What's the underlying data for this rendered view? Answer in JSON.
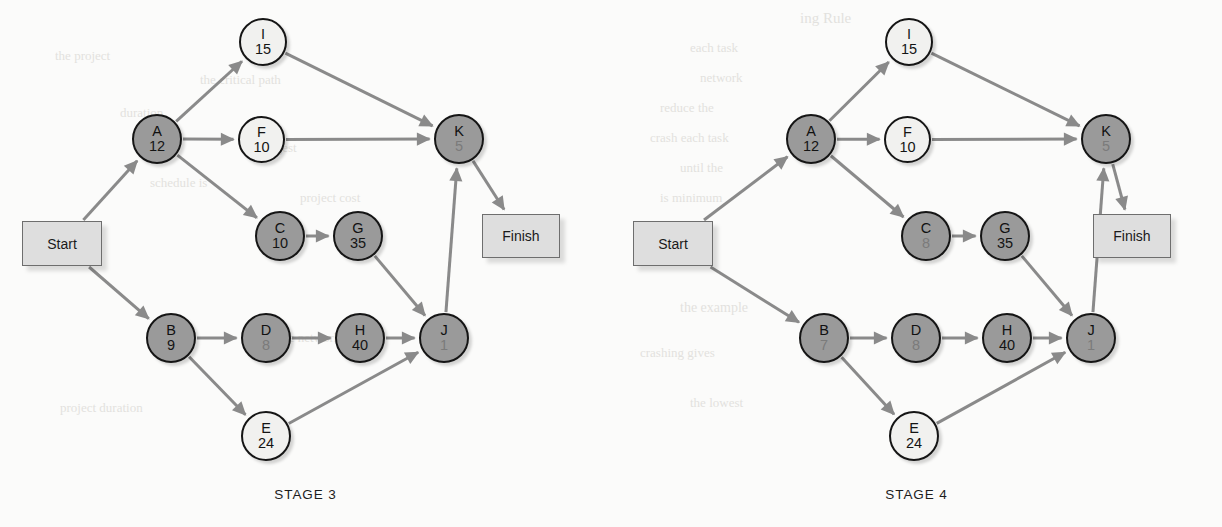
{
  "figure": {
    "background_color": "#fbfbfa",
    "node_dark_color": "#9a9a9a",
    "node_light_color": "#f1f1ef",
    "edge_color": "#8a8a8a",
    "terminal_box_color": "#dedede"
  },
  "bleed_text": [
    {
      "text": "ing Rule",
      "x": 800,
      "y": 10,
      "size": 15
    },
    {
      "text": "the project",
      "x": 55,
      "y": 48,
      "size": 13
    },
    {
      "text": "each task",
      "x": 690,
      "y": 40,
      "size": 13
    },
    {
      "text": "the critical path",
      "x": 200,
      "y": 72,
      "size": 13
    },
    {
      "text": "network",
      "x": 700,
      "y": 70,
      "size": 13
    },
    {
      "text": "duration",
      "x": 120,
      "y": 105,
      "size": 13
    },
    {
      "text": "reduce the",
      "x": 660,
      "y": 100,
      "size": 13
    },
    {
      "text": "the longest",
      "x": 240,
      "y": 140,
      "size": 13
    },
    {
      "text": "crash each task",
      "x": 650,
      "y": 130,
      "size": 13
    },
    {
      "text": "schedule is",
      "x": 150,
      "y": 175,
      "size": 13
    },
    {
      "text": "until the",
      "x": 680,
      "y": 160,
      "size": 13
    },
    {
      "text": "project cost",
      "x": 300,
      "y": 190,
      "size": 13
    },
    {
      "text": "is minimum",
      "x": 660,
      "y": 190,
      "size": 13
    },
    {
      "text": "the example",
      "x": 680,
      "y": 300,
      "size": 14
    },
    {
      "text": "from the network",
      "x": 250,
      "y": 330,
      "size": 13
    },
    {
      "text": "crashing gives",
      "x": 640,
      "y": 345,
      "size": 13
    },
    {
      "text": "project duration",
      "x": 60,
      "y": 400,
      "size": 13
    },
    {
      "text": "the lowest",
      "x": 690,
      "y": 395,
      "size": 13
    }
  ],
  "stages": [
    {
      "label": "STAGE 3",
      "name": "stage-3",
      "offset_x": 0,
      "start_box": {
        "label": "Start",
        "x": 22,
        "y": 221,
        "w": 80,
        "h": 45
      },
      "finish_box": {
        "label": "Finish",
        "x": 482,
        "y": 214,
        "w": 78,
        "h": 44
      },
      "nodes": [
        {
          "id": "I",
          "duration": "15",
          "x": 239,
          "y": 18,
          "d": 48,
          "shade": "light",
          "dur_visible": true
        },
        {
          "id": "A",
          "duration": "12",
          "x": 132,
          "y": 114,
          "d": 50,
          "shade": "dark",
          "dur_visible": true
        },
        {
          "id": "F",
          "duration": "10",
          "x": 238,
          "y": 116,
          "d": 47,
          "shade": "light",
          "dur_visible": true
        },
        {
          "id": "K",
          "duration": "5",
          "x": 434,
          "y": 114,
          "d": 50,
          "shade": "dark",
          "dur_visible": false
        },
        {
          "id": "C",
          "duration": "10",
          "x": 255,
          "y": 211,
          "d": 50,
          "shade": "dark",
          "dur_visible": true
        },
        {
          "id": "G",
          "duration": "35",
          "x": 333,
          "y": 211,
          "d": 50,
          "shade": "dark",
          "dur_visible": true
        },
        {
          "id": "B",
          "duration": "9",
          "x": 146,
          "y": 313,
          "d": 50,
          "shade": "dark",
          "dur_visible": true
        },
        {
          "id": "D",
          "duration": "8",
          "x": 241,
          "y": 313,
          "d": 50,
          "shade": "dark",
          "dur_visible": false
        },
        {
          "id": "H",
          "duration": "40",
          "x": 335,
          "y": 313,
          "d": 50,
          "shade": "dark",
          "dur_visible": true
        },
        {
          "id": "J",
          "duration": "1",
          "x": 419,
          "y": 313,
          "d": 50,
          "shade": "dark",
          "dur_visible": false
        },
        {
          "id": "E",
          "duration": "24",
          "x": 241,
          "y": 411,
          "d": 50,
          "shade": "light",
          "dur_visible": true
        }
      ],
      "edges": [
        {
          "from": "Start",
          "to": "A"
        },
        {
          "from": "Start",
          "to": "B"
        },
        {
          "from": "A",
          "to": "I"
        },
        {
          "from": "A",
          "to": "F"
        },
        {
          "from": "A",
          "to": "C"
        },
        {
          "from": "I",
          "to": "K"
        },
        {
          "from": "F",
          "to": "K"
        },
        {
          "from": "C",
          "to": "G"
        },
        {
          "from": "G",
          "to": "J"
        },
        {
          "from": "B",
          "to": "D"
        },
        {
          "from": "B",
          "to": "E"
        },
        {
          "from": "D",
          "to": "H"
        },
        {
          "from": "H",
          "to": "J"
        },
        {
          "from": "E",
          "to": "J"
        },
        {
          "from": "J",
          "to": "K"
        },
        {
          "from": "K",
          "to": "Finish"
        }
      ]
    },
    {
      "label": "STAGE 4",
      "name": "stage-4",
      "offset_x": 611,
      "start_box": {
        "label": "Start",
        "x": 22,
        "y": 221,
        "w": 80,
        "h": 45
      },
      "finish_box": {
        "label": "Finish",
        "x": 482,
        "y": 214,
        "w": 78,
        "h": 44
      },
      "nodes": [
        {
          "id": "I",
          "duration": "15",
          "x": 274,
          "y": 18,
          "d": 48,
          "shade": "light",
          "dur_visible": true
        },
        {
          "id": "A",
          "duration": "12",
          "x": 175,
          "y": 114,
          "d": 50,
          "shade": "dark",
          "dur_visible": true
        },
        {
          "id": "F",
          "duration": "10",
          "x": 273,
          "y": 116,
          "d": 47,
          "shade": "light",
          "dur_visible": true
        },
        {
          "id": "K",
          "duration": "5",
          "x": 470,
          "y": 114,
          "d": 50,
          "shade": "dark",
          "dur_visible": false
        },
        {
          "id": "C",
          "duration": "8",
          "x": 290,
          "y": 211,
          "d": 50,
          "shade": "dark",
          "dur_visible": false
        },
        {
          "id": "G",
          "duration": "35",
          "x": 369,
          "y": 211,
          "d": 50,
          "shade": "dark",
          "dur_visible": true
        },
        {
          "id": "B",
          "duration": "7",
          "x": 188,
          "y": 313,
          "d": 50,
          "shade": "dark",
          "dur_visible": false
        },
        {
          "id": "D",
          "duration": "8",
          "x": 280,
          "y": 313,
          "d": 50,
          "shade": "dark",
          "dur_visible": false
        },
        {
          "id": "H",
          "duration": "40",
          "x": 371,
          "y": 313,
          "d": 50,
          "shade": "dark",
          "dur_visible": true
        },
        {
          "id": "J",
          "duration": "1",
          "x": 455,
          "y": 313,
          "d": 50,
          "shade": "dark",
          "dur_visible": false
        },
        {
          "id": "E",
          "duration": "24",
          "x": 278,
          "y": 411,
          "d": 50,
          "shade": "light",
          "dur_visible": true
        }
      ],
      "edges": [
        {
          "from": "Start",
          "to": "A"
        },
        {
          "from": "Start",
          "to": "B"
        },
        {
          "from": "A",
          "to": "I"
        },
        {
          "from": "A",
          "to": "F"
        },
        {
          "from": "A",
          "to": "C"
        },
        {
          "from": "I",
          "to": "K"
        },
        {
          "from": "F",
          "to": "K"
        },
        {
          "from": "C",
          "to": "G"
        },
        {
          "from": "G",
          "to": "J"
        },
        {
          "from": "B",
          "to": "D"
        },
        {
          "from": "B",
          "to": "E"
        },
        {
          "from": "D",
          "to": "H"
        },
        {
          "from": "H",
          "to": "J"
        },
        {
          "from": "E",
          "to": "J"
        },
        {
          "from": "J",
          "to": "K"
        },
        {
          "from": "K",
          "to": "Finish"
        }
      ]
    }
  ]
}
